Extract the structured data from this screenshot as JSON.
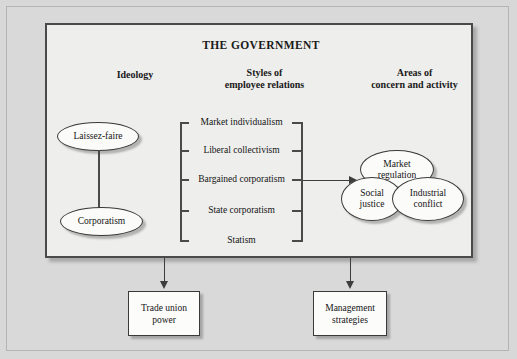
{
  "diagram": {
    "title": "THE GOVERNMENT",
    "columns": {
      "ideology": "Ideology",
      "styles": "Styles of\nemployee relations",
      "styles_line1": "Styles of",
      "styles_line2": "employee relations",
      "areas_line1": "Areas of",
      "areas_line2": "concern and activity"
    },
    "ideology_nodes": [
      {
        "label": "Laissez-faire"
      },
      {
        "label": "Corporatism"
      }
    ],
    "style_items": [
      {
        "label": "Market individualism",
        "has_ticks": true
      },
      {
        "label": "Liberal collectivism",
        "has_ticks": true
      },
      {
        "label": "Bargained corporatism",
        "has_ticks": true
      },
      {
        "label": "State corporatism",
        "has_ticks": true
      },
      {
        "label": "Statism",
        "has_ticks": false
      }
    ],
    "area_nodes": [
      {
        "line1": "Market",
        "line2": "regulation"
      },
      {
        "line1": "Social",
        "line2": "justice"
      },
      {
        "line1": "Industrial",
        "line2": "conflict"
      }
    ],
    "outcome_boxes": [
      {
        "line1": "Trade union",
        "line2": "power"
      },
      {
        "line1": "Management",
        "line2": "strategies"
      }
    ],
    "colors": {
      "page_background": "#d8d8d8",
      "panel_background": "#eeeeec",
      "node_fill": "#fbfbfa",
      "line": "#3d3d3d",
      "border": "#4a4a4a",
      "text": "#141414"
    }
  }
}
